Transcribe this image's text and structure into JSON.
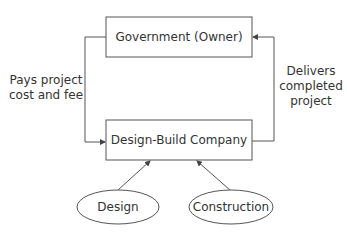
{
  "diagram": {
    "nodes": {
      "government": {
        "label": "Government (Owner)",
        "shape": "rectangle"
      },
      "company": {
        "label": "Design-Build Company",
        "shape": "rectangle"
      },
      "design": {
        "label": "Design",
        "shape": "ellipse"
      },
      "construction": {
        "label": "Construction",
        "shape": "ellipse"
      }
    },
    "edges": {
      "pays": {
        "from": "government",
        "to": "company",
        "label_line1": "Pays project",
        "label_line2": "cost and fee"
      },
      "delivers": {
        "from": "company",
        "to": "government",
        "label_line1": "Delivers",
        "label_line2": "completed",
        "label_line3": "project"
      },
      "design_to_company": {
        "from": "design",
        "to": "company"
      },
      "construction_to_company": {
        "from": "construction",
        "to": "company"
      }
    },
    "colors": {
      "stroke": "#444444",
      "text": "#333333",
      "background": "#ffffff"
    }
  }
}
